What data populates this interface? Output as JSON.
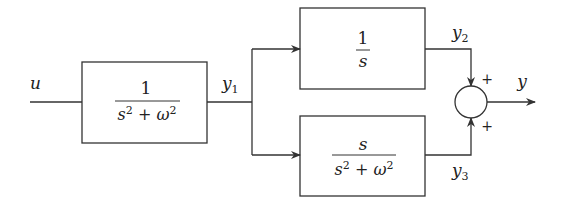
{
  "diagram": {
    "type": "block-diagram",
    "input_label": "u",
    "output_label": "y",
    "blocks": [
      {
        "id": "G1",
        "numerator": "1",
        "denominator": "s² + ω²",
        "output_signal": "y₁"
      },
      {
        "id": "G2",
        "numerator": "1",
        "denominator": "s",
        "output_signal": "y₂"
      },
      {
        "id": "G3",
        "numerator": "s",
        "denominator": "s² + ω²",
        "output_signal": "y₃"
      }
    ],
    "signals": {
      "y1": "y",
      "y1_sub": "1",
      "y2": "y",
      "y2_sub": "2",
      "y3": "y",
      "y3_sub": "3"
    },
    "summing_junction": {
      "top_sign": "+",
      "bottom_sign": "+"
    },
    "colors": {
      "stroke": "#333333",
      "background": "#ffffff"
    }
  }
}
